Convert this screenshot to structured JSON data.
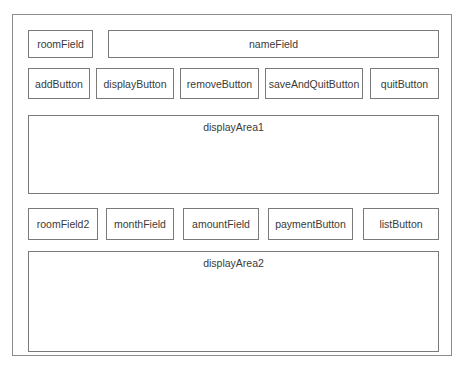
{
  "row1": {
    "room_field": "roomField",
    "name_field": "nameField"
  },
  "row2": {
    "buttons": [
      {
        "label": "addButton"
      },
      {
        "label": "displayButton"
      },
      {
        "label": "removeButton"
      },
      {
        "label": "saveAndQuitButton"
      },
      {
        "label": "quitButton"
      }
    ]
  },
  "display_area_1": {
    "label": "displayArea1"
  },
  "row3": {
    "items": [
      {
        "label": "roomField2"
      },
      {
        "label": "monthField"
      },
      {
        "label": "amountField"
      },
      {
        "label": "paymentButton"
      },
      {
        "label": "listButton"
      }
    ]
  },
  "display_area_2": {
    "label": "displayArea2"
  },
  "colors": {
    "border": "#7a7a7a",
    "frame_border": "#8c8c8c",
    "text": "#3a3a3a",
    "background": "#ffffff"
  }
}
